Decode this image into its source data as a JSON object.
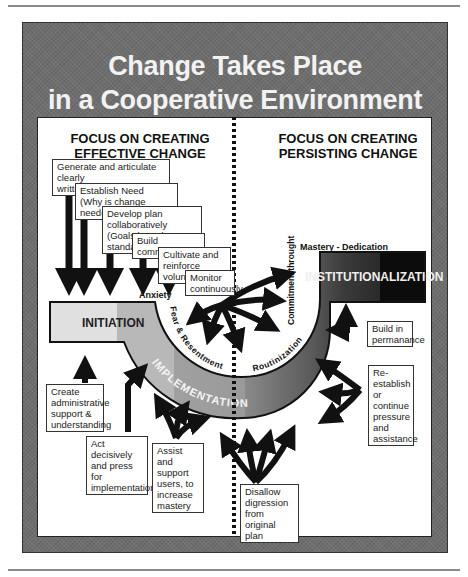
{
  "title": {
    "line1": "Change Takes Place",
    "line2": "in a Cooperative Environment"
  },
  "left_heading": {
    "line1": "FOCUS ON CREATING",
    "line2": "EFFECTIVE CHANGE"
  },
  "right_heading": {
    "line1": "FOCUS ON CREATING",
    "line2": "PERSISTING CHANGE"
  },
  "stages": {
    "initiation": "INITIATION",
    "implementation": "IMPLEMENTATION",
    "institutionalization": "INSTITUTIONALIZATION"
  },
  "curve_labels": {
    "anxiety": "Anxiety",
    "fear": "Fear & Resentment",
    "routinization": "Routinization",
    "commitment": "Commitment throught",
    "mastery": "Mastery - Dedication"
  },
  "top_boxes": [
    {
      "line1": "Generate and articulate clearly",
      "line2": "written vision."
    },
    {
      "line1": "Establish Need",
      "line2": "(Why is change needed?)"
    },
    {
      "line1": "Develop plan collaboratively",
      "line2": "(Goals based on standards)"
    },
    {
      "line1": "Build commitment",
      "line2": ""
    },
    {
      "line1": "Cultivate and",
      "line2": "reinforce volunteers"
    },
    {
      "line1": "Monitor",
      "line2": "continuously"
    }
  ],
  "bottom_boxes": {
    "create": [
      "Create",
      "administrative",
      "support &",
      "understanding"
    ],
    "act": [
      "Act decisively",
      "and press for",
      "implementation"
    ],
    "assist": [
      "Assist",
      "and support",
      "users, to",
      "increase",
      "mastery"
    ],
    "disallow": [
      "Disallow",
      "digression from",
      "original plan"
    ],
    "reestablish": [
      "Re-establish",
      "or continue",
      "pressure",
      "and",
      "assistance"
    ],
    "build": [
      "Build in",
      "permanance"
    ]
  },
  "colors": {
    "frame": "#6e6e6e",
    "stage_light": "#d9d9d9",
    "stage_mid": "#a8a8a8",
    "stage_dark": "#4a4a4a",
    "stage_black": "#111111"
  }
}
